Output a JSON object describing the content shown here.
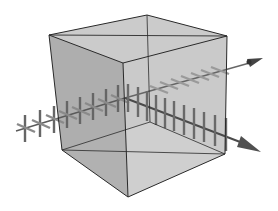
{
  "diagram": {
    "colors": {
      "background": "#ffffff",
      "cube_left_face": "#9a9a9a",
      "cube_right_face": "#c4c4c4",
      "cube_top_face": "#c8c8c8",
      "cube_bottom_face": "#e2e2e2",
      "cube_edges": "#2a2a2a",
      "beam": "#555555",
      "tick_vertical": "#6a6a6a",
      "tick_horizontal": "#8a8a8a"
    },
    "beams": [
      {
        "name": "incident-beam",
        "polarization": "both"
      },
      {
        "name": "transmitted-beam",
        "polarization": "vertical"
      },
      {
        "name": "reflected-beam",
        "polarization": "horizontal"
      }
    ]
  }
}
